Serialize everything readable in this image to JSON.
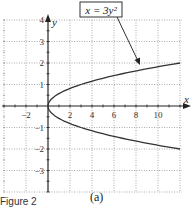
{
  "chart_data": {
    "type": "line",
    "title": "",
    "annotation": "x = 3y²",
    "xlabel": "x",
    "ylabel": "y",
    "xlim": [
      -4,
      12
    ],
    "ylim": [
      -4,
      4
    ],
    "x_ticks": [
      -2,
      2,
      4,
      6,
      8,
      10
    ],
    "y_ticks": [
      -3,
      -2,
      -1,
      1,
      2,
      3,
      4
    ],
    "grid": true,
    "series": [
      {
        "name": "x = 3y²",
        "equation": "x = 3y^2",
        "points": [
          [
            12,
            -2
          ],
          [
            6.75,
            -1.5
          ],
          [
            3,
            -1
          ],
          [
            0.75,
            -0.5
          ],
          [
            0,
            0
          ],
          [
            0.75,
            0.5
          ],
          [
            3,
            1
          ],
          [
            6.75,
            1.5
          ],
          [
            12,
            2
          ]
        ]
      }
    ]
  },
  "labels": {
    "annotation": "x = 3y²",
    "x_axis": "x",
    "y_axis": "y",
    "subfigure": "(a)",
    "caption": "Figure 2"
  },
  "colors": {
    "curve": "#333333",
    "grid": "#888888",
    "axis": "#222222"
  }
}
